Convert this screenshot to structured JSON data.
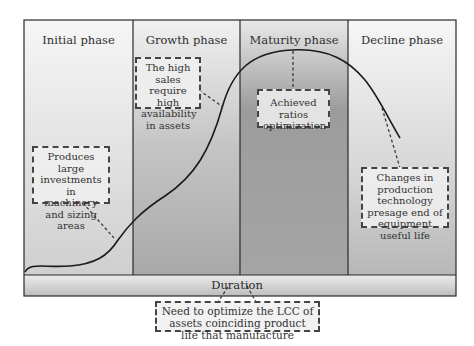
{
  "phases": [
    {
      "label": "Initial phase"
    },
    {
      "label": "Growth phase"
    },
    {
      "label": "Maturity phase"
    },
    {
      "label": "Decline phase"
    }
  ],
  "notes": {
    "initial": "Produces large investments in machinery and sizing areas",
    "growth": "The high sales require high availability in assets",
    "maturity": "Achieved ratios optimization",
    "decline": "Changes in production technology presage end of equipment useful life",
    "duration": "Need to optimize the LCC of assets coinciding product life that manufacture"
  },
  "axis": {
    "duration_label": "Duration"
  },
  "colors": {
    "frame": "#2b2b2b",
    "curve": "#1a1a1a",
    "light_gradient_top": "#f4f4f4",
    "light_gradient_bottom": "#c8c8c8",
    "dark_gradient_top": "#e6e6e6",
    "dark_gradient_bottom": "#8f8f8f"
  }
}
